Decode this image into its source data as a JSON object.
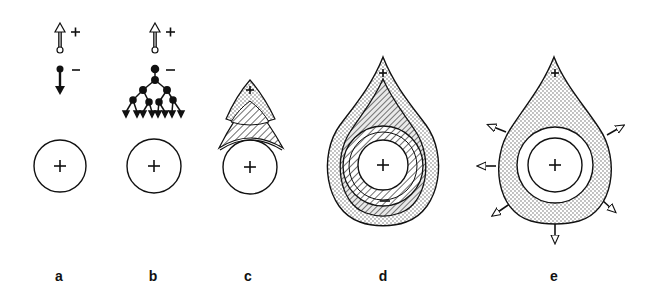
{
  "figure": {
    "panels": [
      {
        "id": "a",
        "label": "a",
        "description": "Single neuron: excitatory input arrow (+) and single inhibitory output (−) above a cell body marked +"
      },
      {
        "id": "b",
        "label": "b",
        "description": "Excitatory input (+) and branching inhibitory tree (−) ending in eight arrowheads above a cell body marked +"
      },
      {
        "id": "c",
        "label": "c",
        "description": "Cell body with stippled excitatory cap (+) over a hatched region"
      },
      {
        "id": "d",
        "label": "d",
        "description": "Teardrop field with stippled outer band, hatched inner bands, central cell + and − at bottom"
      },
      {
        "id": "e",
        "label": "e",
        "description": "Stippled teardrop field around a ring and cell +, with six outward arrows"
      }
    ],
    "signs": {
      "plus": "+",
      "minus": "−"
    },
    "colors": {
      "ink": "#111111",
      "background": "#ffffff",
      "stipple": "#555555"
    }
  }
}
